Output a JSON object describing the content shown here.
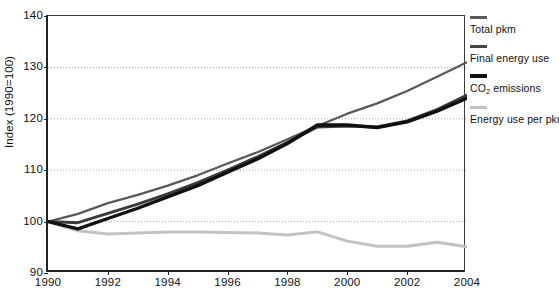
{
  "chart_data": {
    "type": "line",
    "title": "",
    "subtitle": "",
    "xlabel": "",
    "ylabel": "Index (1990=100)",
    "xlim": [
      1990,
      2004
    ],
    "ylim": [
      90,
      140
    ],
    "yticks": [
      90,
      100,
      110,
      120,
      130,
      140
    ],
    "xticks": [
      1990,
      1992,
      1994,
      1996,
      1998,
      2000,
      2002,
      2004
    ],
    "gridlines": [
      100,
      110,
      120,
      130
    ],
    "grid": "horizontal-dotted",
    "legend_position": "right",
    "x": [
      1990,
      1991,
      1992,
      1993,
      1994,
      1995,
      1996,
      1997,
      1998,
      1999,
      2000,
      2001,
      2002,
      2003,
      2004
    ],
    "series": [
      {
        "name": "Total pkm",
        "color": "#595959",
        "width": 2.2,
        "values": [
          100.0,
          101.5,
          103.6,
          105.2,
          107.0,
          109.0,
          111.3,
          113.5,
          116.0,
          118.6,
          121.0,
          123.0,
          125.4,
          128.2,
          131.0
        ]
      },
      {
        "name": "Final energy use",
        "color": "#3b3b3b",
        "width": 3.0,
        "values": [
          100.0,
          99.8,
          101.6,
          103.4,
          105.4,
          107.6,
          110.0,
          112.6,
          115.4,
          118.4,
          118.6,
          118.4,
          119.6,
          121.8,
          124.6
        ]
      },
      {
        "name": "CO2 emissions",
        "color": "#101010",
        "width": 3.4,
        "values": [
          100.0,
          98.6,
          100.6,
          102.6,
          104.8,
          107.0,
          109.6,
          112.2,
          115.2,
          118.8,
          118.8,
          118.3,
          119.4,
          121.5,
          124.0
        ]
      },
      {
        "name": "Energy use per pkm",
        "color": "#c2c2c2",
        "width": 3.0,
        "values": [
          100.0,
          98.2,
          97.6,
          97.8,
          98.0,
          98.0,
          97.9,
          97.8,
          97.4,
          98.0,
          96.2,
          95.2,
          95.2,
          96.0,
          95.1
        ]
      }
    ]
  },
  "legend": {
    "items": [
      {
        "label": "Total pkm",
        "color": "#595959",
        "thickness": 3
      },
      {
        "label": "Final energy use",
        "color": "#444444",
        "thickness": 3
      },
      {
        "label": "CO2 emissions",
        "color": "#111111",
        "thickness": 4,
        "html": "CO<sub>2</sub> emissions"
      },
      {
        "label": "Energy use per pkm",
        "color": "#c2c2c2",
        "thickness": 3
      }
    ]
  },
  "axis": {
    "y_title": "Index (1990=100)",
    "y_labels": [
      "140",
      "130",
      "120",
      "110",
      "100",
      "90"
    ],
    "x_labels": [
      "1990",
      "1992",
      "1994",
      "1996",
      "1998",
      "2000",
      "2002",
      "2004"
    ]
  }
}
